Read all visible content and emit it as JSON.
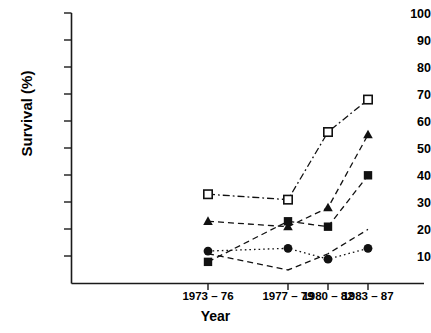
{
  "chart_data": {
    "type": "line",
    "title": "",
    "xlabel": "Year",
    "ylabel": "Survival (%)",
    "categories": [
      "1973 – 76",
      "1977 – 79",
      "1980 – 82",
      "1983 – 87"
    ],
    "ylim": [
      0,
      100
    ],
    "yticks": [
      10,
      20,
      30,
      40,
      50,
      60,
      70,
      80,
      90,
      100
    ],
    "grid": false,
    "legend": "none",
    "series": [
      {
        "name": "open-square",
        "marker": "open-square",
        "line": "dash-dot",
        "values": [
          33,
          31,
          56,
          68
        ]
      },
      {
        "name": "triangle",
        "marker": "filled-triangle",
        "line": "dashed",
        "values": [
          23,
          21,
          28,
          55
        ]
      },
      {
        "name": "filled-square",
        "marker": "filled-square",
        "line": "dashed",
        "values": [
          8,
          23,
          21,
          40
        ]
      },
      {
        "name": "circle",
        "marker": "filled-circle",
        "line": "dotted",
        "values": [
          12,
          13,
          9,
          13
        ]
      },
      {
        "name": "lower-dashed",
        "marker": "none",
        "line": "dashed",
        "values": [
          11,
          5,
          11,
          20
        ]
      }
    ]
  },
  "axis": {
    "y_title": "Survival (%)",
    "x_title": "Year",
    "y_tick_labels": [
      "100",
      "90",
      "80",
      "70",
      "60",
      "50",
      "40",
      "30",
      "20",
      "10"
    ],
    "x_tick_labels": [
      "1973 – 76",
      "1977 – 79",
      "1980 – 82",
      "1983 – 87"
    ]
  },
  "colors": {
    "axis": "#1a1a1a",
    "series": "#111111",
    "background": "#ffffff"
  }
}
